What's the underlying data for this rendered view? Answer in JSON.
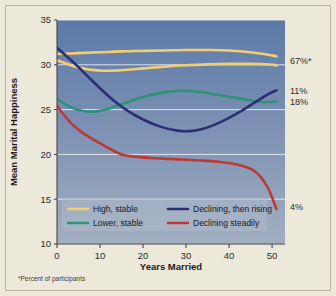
{
  "chart_data": {
    "type": "line",
    "title": "",
    "xlabel": "Years Married",
    "ylabel": "Mean Marital Happiness",
    "xlim": [
      0,
      53
    ],
    "ylim": [
      10,
      35
    ],
    "xticks": [
      0,
      10,
      20,
      30,
      40,
      50
    ],
    "yticks": [
      10,
      15,
      20,
      25,
      30,
      35
    ],
    "grid": true,
    "legend_position": "bottom-inside",
    "footnote": "*Percent of participants",
    "series": [
      {
        "name": "High, stable",
        "color": "#F2CE72",
        "percent_label": "67%*",
        "sublines": [
          {
            "x": [
              0,
              5,
              10,
              15,
              20,
              25,
              30,
              35,
              40,
              45,
              50,
              51
            ],
            "y": [
              31.2,
              31.3,
              31.4,
              31.5,
              31.55,
              31.6,
              31.65,
              31.65,
              31.6,
              31.4,
              31.05,
              30.95
            ]
          },
          {
            "x": [
              0,
              5,
              10,
              15,
              20,
              25,
              30,
              35,
              40,
              45,
              50,
              51
            ],
            "y": [
              30.5,
              29.7,
              29.35,
              29.4,
              29.6,
              29.8,
              29.95,
              30.05,
              30.1,
              30.1,
              30.0,
              29.9
            ]
          }
        ]
      },
      {
        "name": "Lower, stable",
        "color": "#2E9178",
        "percent_label": "18%",
        "x": [
          0,
          3,
          6,
          9,
          12,
          15,
          20,
          25,
          29,
          33,
          38,
          43,
          46,
          48,
          50,
          51
        ],
        "y": [
          26.2,
          25.3,
          24.85,
          24.8,
          25.1,
          25.6,
          26.4,
          26.95,
          27.1,
          27.0,
          26.6,
          26.2,
          25.95,
          25.85,
          25.85,
          25.9
        ]
      },
      {
        "name": "Declining, then rising",
        "color": "#2B2F73",
        "percent_label": "11%",
        "x": [
          0,
          4,
          8,
          12,
          16,
          20,
          24,
          28,
          31,
          34,
          38,
          42,
          46,
          49,
          51
        ],
        "y": [
          31.9,
          30.2,
          28.3,
          26.5,
          25.0,
          23.9,
          23.1,
          22.65,
          22.6,
          22.85,
          23.6,
          24.6,
          25.8,
          26.7,
          27.15
        ]
      },
      {
        "name": "Declining steadily",
        "color": "#BC3A34",
        "percent_label": "4%",
        "x": [
          0,
          3,
          6,
          9,
          12,
          15,
          18,
          22,
          26,
          30,
          34,
          38,
          42,
          45,
          47,
          49,
          50,
          51
        ],
        "y": [
          25.4,
          23.6,
          22.4,
          21.5,
          20.7,
          20.0,
          19.75,
          19.6,
          19.5,
          19.4,
          19.3,
          19.15,
          18.85,
          18.4,
          17.7,
          16.3,
          15.2,
          13.9
        ]
      }
    ],
    "side_labels": [
      {
        "text": "67%*",
        "value": 30.45
      },
      {
        "text": "11%",
        "value": 27.15
      },
      {
        "text": "18%",
        "value": 25.85
      },
      {
        "text": "4%",
        "value": 14.2
      }
    ],
    "legend": [
      {
        "label": "High, stable",
        "color": "#F2CE72"
      },
      {
        "label": "Declining, then rising",
        "color": "#2B2F73"
      },
      {
        "label": "Lower, stable",
        "color": "#2E9178"
      },
      {
        "label": "Declining steadily",
        "color": "#BC3A34"
      }
    ]
  },
  "colors": {
    "page_background": "#ECE8DA",
    "plot_top": "#5B7AA8",
    "plot_bottom": "#9FADC0",
    "gridline": "#F2F4F6",
    "axis": "#3a3a3a",
    "legend_panel": "#AEB9C9"
  }
}
